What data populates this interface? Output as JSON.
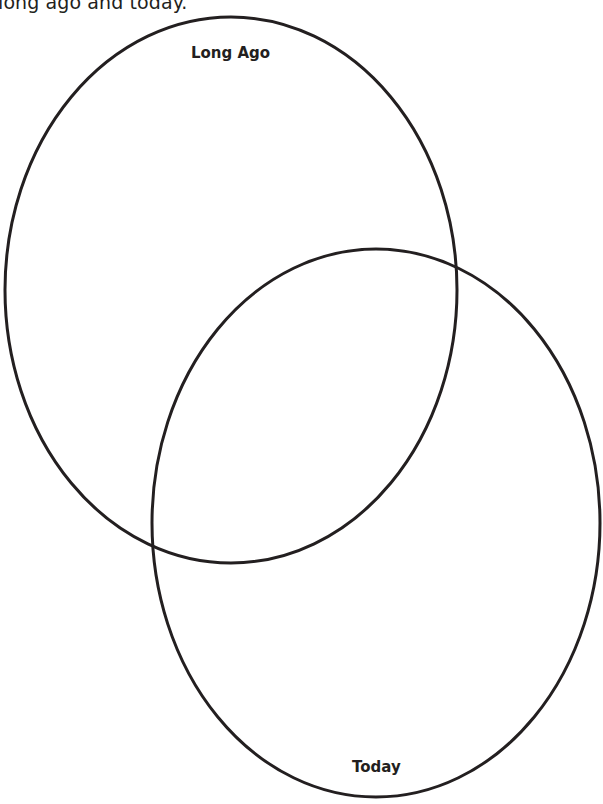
{
  "instruction": {
    "text": "long ago and today."
  },
  "venn": {
    "circles": [
      {
        "id": "long-ago",
        "label": "Long Ago",
        "cx": 231,
        "cy": 290,
        "rx": 226,
        "ry": 273
      },
      {
        "id": "today",
        "label": "Today",
        "cx": 376,
        "cy": 523,
        "rx": 224,
        "ry": 274
      }
    ],
    "stroke_color": "#231f20",
    "stroke_width": 3
  }
}
